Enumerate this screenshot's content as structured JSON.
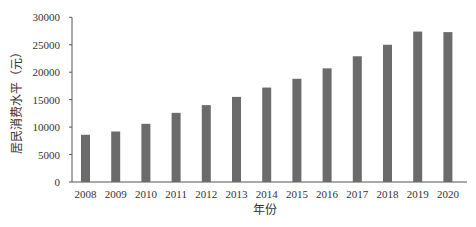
{
  "chart_data": {
    "type": "bar",
    "title": "",
    "xlabel": "年份",
    "ylabel": "居民消费水平（元）",
    "categories": [
      "2008",
      "2009",
      "2010",
      "2011",
      "2012",
      "2013",
      "2014",
      "2015",
      "2016",
      "2017",
      "2018",
      "2019",
      "2020"
    ],
    "values": [
      8600,
      9200,
      10600,
      12600,
      14000,
      15500,
      17200,
      18800,
      20700,
      22900,
      25000,
      27400,
      27300
    ],
    "ylim": [
      0,
      30000
    ],
    "yticks": [
      0,
      5000,
      10000,
      15000,
      20000,
      25000,
      30000
    ],
    "ytick_labels": [
      "0",
      "5000",
      "10000",
      "15000",
      "20000",
      "25000",
      "30000"
    ],
    "grid": false,
    "legend": null,
    "bar_color": "#6b6b6b",
    "axis_color": "#555555"
  }
}
